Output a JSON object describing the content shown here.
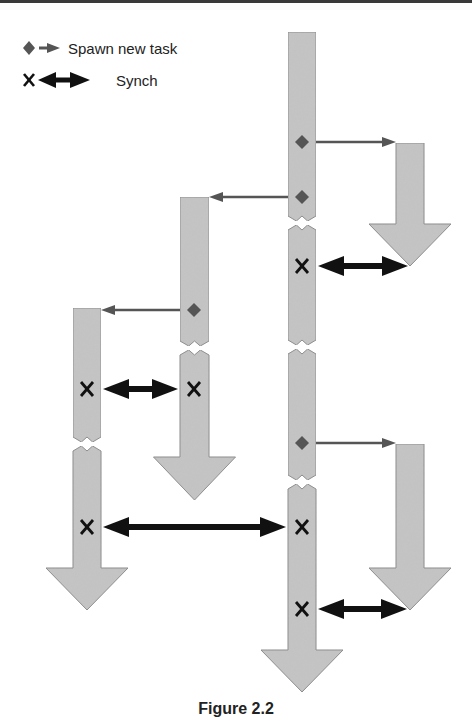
{
  "legend": {
    "spawn_label": "Spawn new task",
    "synch_label": "Synch",
    "spawn_icon": "diamond-with-arrow",
    "synch_icon": "x-with-double-arrow"
  },
  "caption": "Figure 2.2",
  "colors": {
    "task_fill": "#c4c4c4",
    "task_stroke": "#8a8a8a",
    "spawn_marker": "#555555",
    "spawn_arrow": "#555555",
    "synch_arrow": "#111111",
    "synch_marker": "#111111"
  },
  "diagram": {
    "tasks": [
      {
        "id": "main",
        "x": 288,
        "width": 28,
        "top": 32,
        "head_top": 650,
        "tip": 692,
        "head_half": 41,
        "breaks": [
          222,
          346,
          481
        ]
      },
      {
        "id": "child-top-right",
        "x": 396,
        "width": 28,
        "top": 143,
        "head_top": 224,
        "tip": 266,
        "head_half": 41,
        "breaks": []
      },
      {
        "id": "child-middle",
        "x": 180,
        "width": 29,
        "top": 197,
        "head_top": 457,
        "tip": 500,
        "head_half": 41,
        "breaks": [
          347
        ]
      },
      {
        "id": "child-left",
        "x": 73,
        "width": 28,
        "top": 308,
        "head_top": 568,
        "tip": 610,
        "head_half": 41,
        "breaks": [
          443
        ]
      },
      {
        "id": "child-bottom-right",
        "x": 396,
        "width": 28,
        "top": 444,
        "head_top": 568,
        "tip": 610,
        "head_half": 41,
        "breaks": []
      }
    ],
    "spawns": [
      {
        "from": "main",
        "marker_x": 302,
        "y": 142,
        "to_x": 396,
        "direction": "right"
      },
      {
        "from": "main",
        "marker_x": 302,
        "y": 197,
        "to_x": 209,
        "direction": "left"
      },
      {
        "from": "child-middle",
        "marker_x": 194,
        "y": 310,
        "to_x": 101,
        "direction": "left"
      },
      {
        "from": "main",
        "marker_x": 302,
        "y": 443,
        "to_x": 396,
        "direction": "right"
      }
    ],
    "synchs": [
      {
        "marker_x": 302,
        "y": 266,
        "x1": 316,
        "x2": 410
      },
      {
        "marker_x": 87,
        "y": 389,
        "x1": 101,
        "x2": 180,
        "marker2_x": 194
      },
      {
        "marker_x": 87,
        "y": 527,
        "x1": 101,
        "x2": 288,
        "marker2_x": 302
      },
      {
        "marker_x": 302,
        "y": 609,
        "x1": 316,
        "x2": 409
      }
    ]
  }
}
